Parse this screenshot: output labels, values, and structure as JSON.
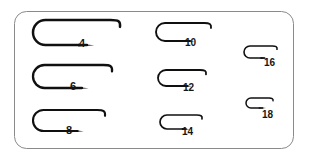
{
  "chart_data": {
    "type": "diagram",
    "xlabel": "",
    "ylabel": "",
    "legend": [],
    "grid": false,
    "categories": [
      "4",
      "6",
      "8",
      "10",
      "12",
      "14",
      "16",
      "18"
    ],
    "values": [
      87,
      79,
      72,
      55,
      48,
      42,
      33,
      27
    ],
    "value_unit": "hook shank length in pixels as drawn",
    "columns": [
      {
        "name": "left-column",
        "sizes": [
          "4",
          "6",
          "8"
        ]
      },
      {
        "name": "middle-column",
        "sizes": [
          "10",
          "12",
          "14"
        ]
      },
      {
        "name": "right-column",
        "sizes": [
          "16",
          "18"
        ]
      }
    ],
    "series": [
      {
        "name": "hook outline length (px)",
        "values": [
          87,
          79,
          72,
          55,
          48,
          42,
          33,
          27
        ]
      }
    ]
  },
  "frame": {
    "border_color": "#8a8a8a",
    "background": "#ffffff",
    "corner_radius": 12
  },
  "hooks": [
    {
      "id": "hook-4",
      "label": "4",
      "name": "hook-size-4",
      "x": 33,
      "y": 20,
      "length": 87,
      "gap": 25,
      "stroke": "#101010",
      "stroke_width": 2.5,
      "label_x": 79,
      "label_y": 38,
      "label_size": 11
    },
    {
      "id": "hook-6",
      "label": "6",
      "name": "hook-size-6",
      "x": 33,
      "y": 65,
      "length": 79,
      "gap": 23,
      "stroke": "#101010",
      "stroke_width": 2.3,
      "label_x": 70,
      "label_y": 81,
      "label_size": 11
    },
    {
      "id": "hook-8",
      "label": "8",
      "name": "hook-size-8",
      "x": 33,
      "y": 110,
      "length": 72,
      "gap": 21,
      "stroke": "#101010",
      "stroke_width": 2.1,
      "label_x": 66,
      "label_y": 125,
      "label_size": 11
    },
    {
      "id": "hook-10",
      "label": "10",
      "name": "hook-size-10",
      "x": 156,
      "y": 23,
      "length": 55,
      "gap": 18,
      "stroke": "#101010",
      "stroke_width": 1.9,
      "label_x": 185,
      "label_y": 38,
      "label_size": 10
    },
    {
      "id": "hook-12",
      "label": "12",
      "name": "hook-size-12",
      "x": 158,
      "y": 70,
      "length": 48,
      "gap": 16,
      "stroke": "#101010",
      "stroke_width": 1.8,
      "label_x": 183,
      "label_y": 83,
      "label_size": 10
    },
    {
      "id": "hook-14",
      "label": "14",
      "name": "hook-size-14",
      "x": 160,
      "y": 115,
      "length": 42,
      "gap": 14,
      "stroke": "#101010",
      "stroke_width": 1.7,
      "label_x": 182,
      "label_y": 127,
      "label_size": 10
    },
    {
      "id": "hook-16",
      "label": "16",
      "name": "hook-size-16",
      "x": 244,
      "y": 46,
      "length": 33,
      "gap": 12,
      "stroke": "#101010",
      "stroke_width": 1.6,
      "label_x": 264,
      "label_y": 58,
      "label_size": 10
    },
    {
      "id": "hook-18",
      "label": "18",
      "name": "hook-size-18",
      "x": 246,
      "y": 98,
      "length": 27,
      "gap": 10,
      "stroke": "#101010",
      "stroke_width": 1.5,
      "label_x": 262,
      "label_y": 110,
      "label_size": 10
    }
  ]
}
